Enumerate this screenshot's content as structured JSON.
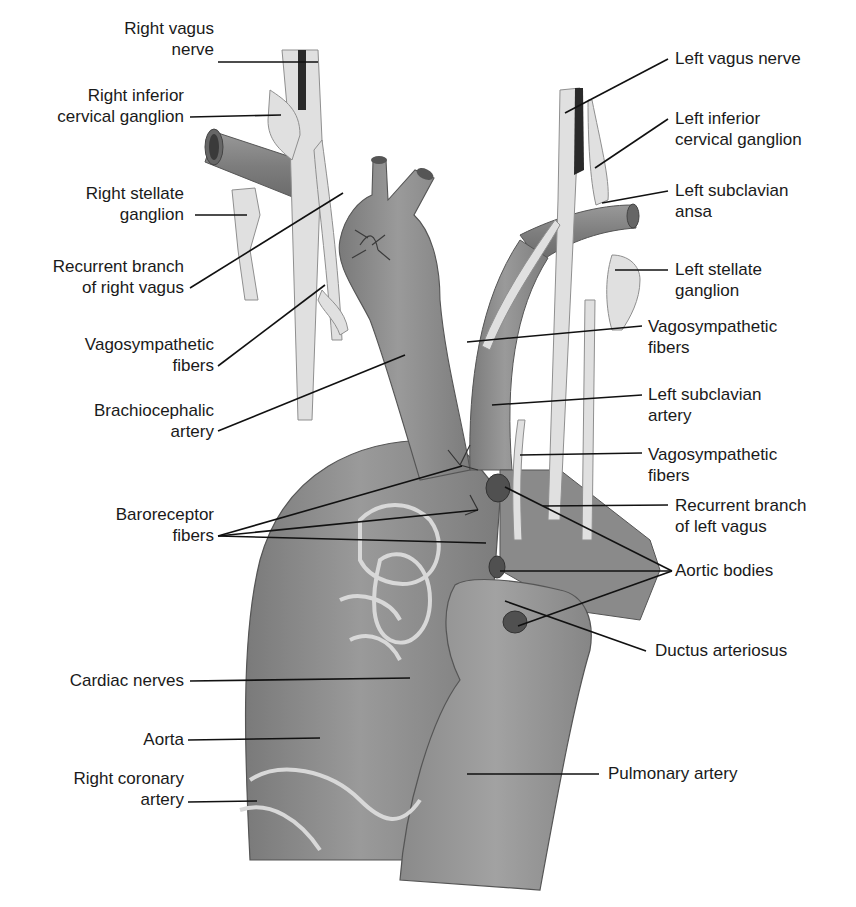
{
  "diagram": {
    "colors": {
      "vessel": "#8c8c8c",
      "vessel_dark": "#6e6e6e",
      "nerve": "#dcdcdc",
      "nerve_outline": "#9a9a9a",
      "aortic_body": "#555555",
      "leader_line": "#111111",
      "text": "#1a1a1a",
      "background": "#ffffff"
    }
  },
  "labels_left": [
    {
      "id": "right-vagus-nerve",
      "lines": [
        "Right vagus",
        "nerve"
      ]
    },
    {
      "id": "right-inferior-cervical-ganglion",
      "lines": [
        "Right inferior",
        "cervical ganglion"
      ]
    },
    {
      "id": "right-stellate-ganglion",
      "lines": [
        "Right stellate",
        "ganglion"
      ]
    },
    {
      "id": "recurrent-branch-right-vagus",
      "lines": [
        "Recurrent branch",
        "of right vagus"
      ]
    },
    {
      "id": "vagosympathetic-fibers-right",
      "lines": [
        "Vagosympathetic",
        "fibers"
      ]
    },
    {
      "id": "brachiocephalic-artery",
      "lines": [
        "Brachiocephalic",
        "artery"
      ]
    },
    {
      "id": "baroreceptor-fibers",
      "lines": [
        "Baroreceptor",
        "fibers"
      ]
    },
    {
      "id": "cardiac-nerves",
      "lines": [
        "Cardiac nerves"
      ]
    },
    {
      "id": "aorta",
      "lines": [
        "Aorta"
      ]
    },
    {
      "id": "right-coronary-artery",
      "lines": [
        "Right coronary",
        "artery"
      ]
    }
  ],
  "labels_right": [
    {
      "id": "left-vagus-nerve",
      "lines": [
        "Left vagus nerve"
      ]
    },
    {
      "id": "left-inferior-cervical-ganglion",
      "lines": [
        "Left inferior",
        "cervical ganglion"
      ]
    },
    {
      "id": "left-subclavian-ansa",
      "lines": [
        "Left subclavian",
        "ansa"
      ]
    },
    {
      "id": "left-stellate-ganglion",
      "lines": [
        "Left stellate",
        "ganglion"
      ]
    },
    {
      "id": "vagosympathetic-fibers-left-upper",
      "lines": [
        "Vagosympathetic",
        "fibers"
      ]
    },
    {
      "id": "left-subclavian-artery",
      "lines": [
        "Left subclavian",
        "artery"
      ]
    },
    {
      "id": "vagosympathetic-fibers-left-lower",
      "lines": [
        "Vagosympathetic",
        "fibers"
      ]
    },
    {
      "id": "recurrent-branch-left-vagus",
      "lines": [
        "Recurrent branch",
        "of left vagus"
      ]
    },
    {
      "id": "aortic-bodies",
      "lines": [
        "Aortic bodies"
      ]
    },
    {
      "id": "ductus-arteriosus",
      "lines": [
        "Ductus arteriosus"
      ]
    },
    {
      "id": "pulmonary-artery",
      "lines": [
        "Pulmonary artery"
      ]
    }
  ]
}
